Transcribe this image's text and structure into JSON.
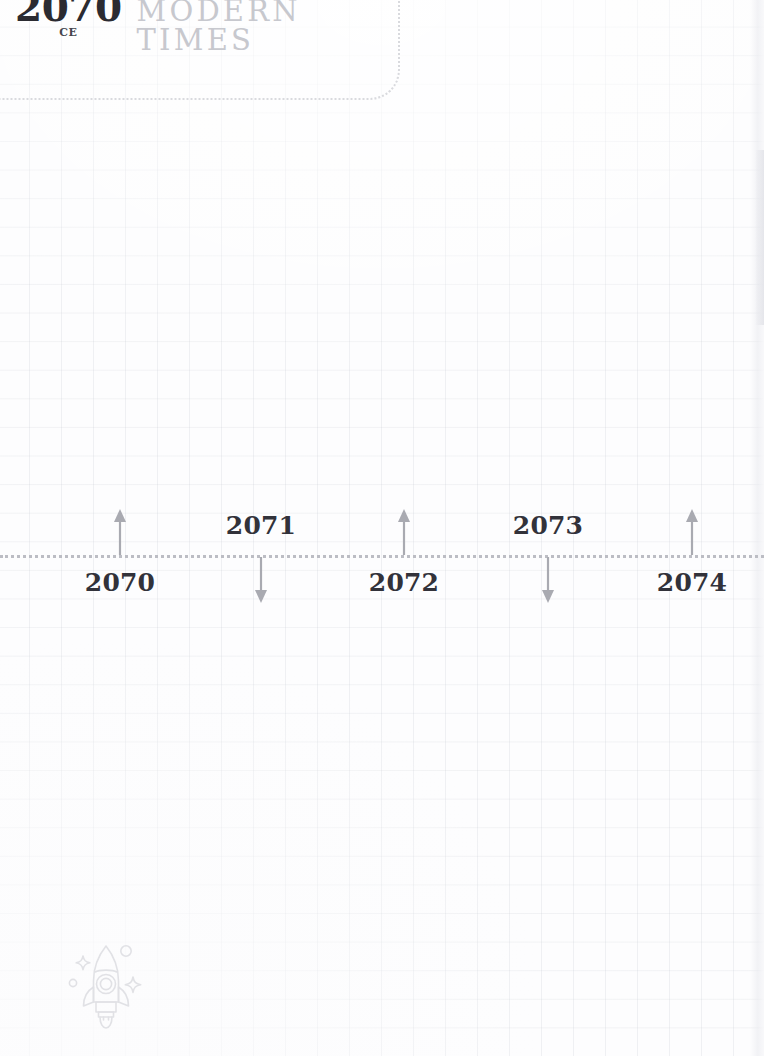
{
  "era_header": {
    "year": "2070",
    "epoch": "CE",
    "name": "MODERN TIMES"
  },
  "timeline": {
    "axis_style": "dotted",
    "ticks": [
      {
        "label": "2070",
        "x": 120,
        "arrow": "up",
        "side": "below",
        "arrow_icon": "arrow-up-icon"
      },
      {
        "label": "2071",
        "x": 261,
        "arrow": "down",
        "side": "above",
        "arrow_icon": "arrow-down-icon"
      },
      {
        "label": "2072",
        "x": 404,
        "arrow": "up",
        "side": "below",
        "arrow_icon": "arrow-up-icon"
      },
      {
        "label": "2073",
        "x": 548,
        "arrow": "down",
        "side": "above",
        "arrow_icon": "arrow-down-icon"
      },
      {
        "label": "2074",
        "x": 692,
        "arrow": "up",
        "side": "below",
        "arrow_icon": "arrow-up-icon"
      }
    ]
  },
  "decoration": {
    "rocket_icon": "rocket-icon"
  },
  "colors": {
    "page_background": "#fdfdfe",
    "grid_line": "#b9bec8",
    "year_text": "#2b2b31",
    "epoch_text": "#46464d",
    "era_name_text": "#c7c8ce",
    "axis_dots": "#bcbdc4",
    "arrow": "#a9aab1",
    "tick_label": "#32323a",
    "rocket_outline": "#d7d8dd",
    "panel_border": "#d9dade"
  }
}
